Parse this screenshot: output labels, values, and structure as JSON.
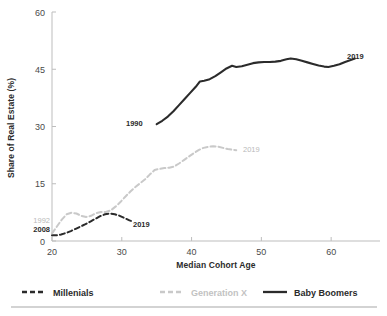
{
  "chart_data": {
    "type": "line",
    "title": "",
    "xlabel": "Median Cohort Age",
    "ylabel": "Share of Real Estate (%)",
    "xlim": [
      20,
      67
    ],
    "ylim": [
      0,
      60
    ],
    "xticks": [
      20,
      30,
      40,
      50,
      60
    ],
    "yticks": [
      0,
      15,
      30,
      45,
      60
    ],
    "grid": false,
    "legend_position": "bottom",
    "series": [
      {
        "name": "Millenials",
        "color": "#2b2b2b",
        "style": "dashed",
        "start_annotation": "2008",
        "end_annotation": "2019",
        "x": [
          20.0,
          20.6,
          21.3,
          22.0,
          22.7,
          23.4,
          24.1,
          24.8,
          25.5,
          26.2,
          26.9,
          27.6,
          28.3,
          29.0,
          29.7,
          30.4,
          31.1,
          31.6
        ],
        "y": [
          1.5,
          1.5,
          1.7,
          2.1,
          2.6,
          3.2,
          3.8,
          4.4,
          5.1,
          5.8,
          6.5,
          7.0,
          7.2,
          7.0,
          6.6,
          6.0,
          5.4,
          5.1
        ]
      },
      {
        "name": "Generation X",
        "color": "#c9c9c9",
        "style": "dashed",
        "start_annotation": "1992",
        "end_annotation": "2019",
        "x": [
          20.0,
          20.7,
          21.4,
          22.1,
          22.8,
          23.5,
          24.2,
          24.9,
          25.6,
          26.3,
          27.0,
          27.7,
          28.4,
          29.1,
          29.8,
          30.5,
          31.2,
          31.9,
          32.6,
          33.3,
          34.0,
          34.7,
          35.4,
          36.1,
          36.8,
          37.5,
          38.2,
          38.9,
          39.6,
          40.3,
          41.0,
          41.7,
          42.4,
          43.1,
          43.8,
          44.5,
          45.2,
          45.9,
          46.4
        ],
        "y": [
          2.0,
          3.8,
          5.6,
          7.0,
          7.4,
          7.2,
          6.6,
          6.3,
          6.6,
          7.3,
          7.6,
          7.6,
          8.0,
          9.0,
          10.2,
          11.6,
          12.9,
          14.1,
          15.1,
          16.1,
          17.4,
          18.6,
          18.9,
          19.1,
          19.2,
          19.5,
          20.3,
          21.2,
          22.1,
          23.0,
          23.8,
          24.4,
          24.7,
          24.8,
          24.7,
          24.4,
          24.1,
          23.9,
          23.8
        ]
      },
      {
        "name": "Baby Boomers",
        "color": "#2b2b2b",
        "style": "solid",
        "start_annotation": "1990",
        "end_annotation": "2019",
        "x": [
          35.0,
          35.8,
          36.6,
          37.4,
          38.2,
          39.0,
          39.8,
          40.6,
          41.2,
          41.8,
          42.6,
          43.4,
          44.2,
          45.0,
          45.8,
          46.4,
          47.2,
          48.0,
          48.8,
          49.6,
          50.4,
          51.2,
          52.0,
          52.8,
          53.6,
          54.2,
          55.0,
          55.8,
          56.6,
          57.4,
          58.2,
          59.0,
          59.6,
          60.4,
          61.2,
          62.0,
          62.8,
          63.4
        ],
        "y": [
          30.6,
          31.5,
          32.6,
          34.0,
          35.6,
          37.2,
          38.8,
          40.4,
          41.8,
          42.0,
          42.4,
          43.2,
          44.2,
          45.2,
          45.9,
          45.6,
          45.8,
          46.2,
          46.6,
          46.8,
          46.9,
          46.9,
          47.0,
          47.2,
          47.6,
          47.8,
          47.6,
          47.2,
          46.8,
          46.4,
          46.0,
          45.7,
          45.6,
          45.9,
          46.3,
          46.9,
          47.4,
          47.8
        ]
      }
    ]
  },
  "legend": {
    "items": [
      {
        "label": "Millenials",
        "color": "#2b2b2b",
        "style": "dashed"
      },
      {
        "label": "Generation X",
        "color": "#c9c9c9",
        "style": "dashed"
      },
      {
        "label": "Baby Boomers",
        "color": "#2b2b2b",
        "style": "solid"
      }
    ]
  },
  "annotations": {
    "millenials_start": "2008",
    "millenials_end": "2019",
    "genx_start": "1992",
    "genx_end": "2019",
    "boomers_start": "1990",
    "boomers_end": "2019"
  },
  "axis": {
    "y_title": "Share of Real Estate (%)",
    "x_title": "Median Cohort Age",
    "y_tick_labels": [
      "60",
      "45",
      "30",
      "15",
      "0"
    ],
    "x_tick_labels": [
      "20",
      "30",
      "40",
      "50",
      "60"
    ]
  },
  "colors": {
    "dark": "#2b2b2b",
    "light_gray": "#c9c9c9",
    "axis": "#bdbdbd",
    "divider": "#a8a8a8",
    "background": "#ffffff"
  }
}
